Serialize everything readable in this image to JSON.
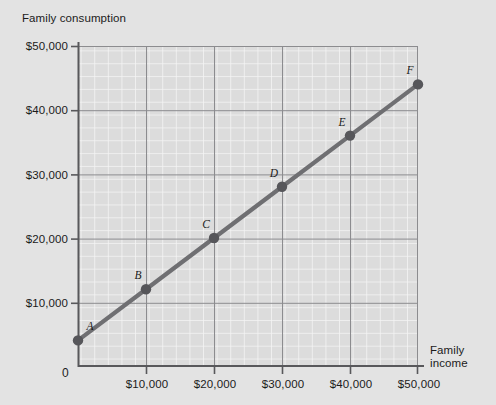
{
  "chart_data": {
    "type": "line",
    "title": "",
    "xlabel": "Family income",
    "ylabel": "Family consumption",
    "xlim": [
      0,
      50000
    ],
    "ylim": [
      0,
      50000
    ],
    "grid": true,
    "legend": "none",
    "xticks": [
      "$10,000",
      "$20,000",
      "$30,000",
      "$40,000",
      "$50,000"
    ],
    "xtick_values": [
      10000,
      20000,
      30000,
      40000,
      50000
    ],
    "yticks": [
      "$10,000",
      "$20,000",
      "$30,000",
      "$40,000",
      "$50,000"
    ],
    "ytick_values": [
      10000,
      20000,
      30000,
      40000,
      50000
    ],
    "origin_label": "0",
    "series": [
      {
        "name": "Consumption function",
        "x": [
          0,
          10000,
          20000,
          30000,
          40000,
          50000
        ],
        "values": [
          4000,
          12000,
          20000,
          28000,
          36000,
          44000
        ],
        "point_labels": [
          "A",
          "B",
          "C",
          "D",
          "E",
          "F"
        ],
        "color": "#6f6f72",
        "marker": "circle"
      }
    ],
    "annotations": [
      {
        "label": "A",
        "x": 0,
        "y": 4000
      },
      {
        "label": "B",
        "x": 10000,
        "y": 12000
      },
      {
        "label": "C",
        "x": 20000,
        "y": 20000
      },
      {
        "label": "D",
        "x": 30000,
        "y": 28000
      },
      {
        "label": "E",
        "x": 40000,
        "y": 36000
      },
      {
        "label": "F",
        "x": 50000,
        "y": 44000
      }
    ]
  },
  "colors": {
    "page_background": "#e3e3e3",
    "plot_background": "#dcdcdc",
    "major_gridline": "#8c8c8f",
    "minor_gridline": "#f2f2f2",
    "axis": "#58585b",
    "line": "#6f6f72",
    "text": "#1b1b1b"
  }
}
